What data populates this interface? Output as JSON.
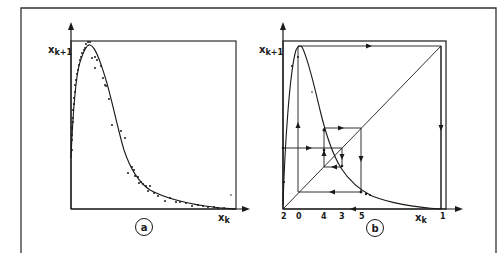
{
  "figure": {
    "panels": [
      {
        "id": "a",
        "tag": "a",
        "ylabel_main": "x",
        "ylabel_sub": "k+1",
        "xlabel_main": "x",
        "xlabel_sub": "k",
        "description": "Return map: scattered data points with fitted smooth unimodal curve"
      },
      {
        "id": "b",
        "tag": "b",
        "ylabel_main": "x",
        "ylabel_sub": "k+1",
        "xlabel_main": "x",
        "xlabel_sub": "k",
        "x_tick_labels": [
          "2",
          "0",
          "4",
          "3",
          "5",
          "1"
        ],
        "description": "Cobweb diagram of the fitted map with diagonal x_{k+1}=x_k and iteration path 0→1→2→3→4→5"
      }
    ]
  },
  "colors": {
    "ink": "#1a1a1a",
    "paper": "#ffffff",
    "frame": "#333333"
  }
}
